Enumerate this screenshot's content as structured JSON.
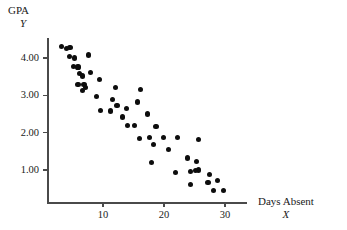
{
  "chart_data": {
    "type": "scatter",
    "title": "",
    "xlabel": "Days Absent",
    "ylabel": "GPA",
    "x_variable": "X",
    "y_variable": "Y",
    "xlim": [
      0,
      33
    ],
    "ylim": [
      0,
      4.6
    ],
    "xticks": [
      10,
      20,
      30
    ],
    "xtick_labels": [
      "10",
      "20",
      "30"
    ],
    "yticks": [
      1.0,
      2.0,
      3.0,
      4.0
    ],
    "ytick_labels": [
      "1.00",
      "2.00",
      "3.00",
      "4.00"
    ],
    "grid": false,
    "legend": false,
    "marker_color": "#0d0d0d",
    "axis_color": "#4a4a4a",
    "series": [
      {
        "name": "Students",
        "points": [
          [
            3.2,
            4.3
          ],
          [
            4.0,
            4.25
          ],
          [
            4.6,
            4.28
          ],
          [
            4.5,
            4.05
          ],
          [
            5.3,
            4.0
          ],
          [
            5.2,
            3.78
          ],
          [
            5.9,
            3.76
          ],
          [
            6.1,
            3.58
          ],
          [
            6.7,
            3.52
          ],
          [
            5.9,
            3.28
          ],
          [
            6.9,
            3.3
          ],
          [
            7.6,
            4.08
          ],
          [
            7.9,
            3.62
          ],
          [
            7.1,
            3.2
          ],
          [
            6.6,
            3.12
          ],
          [
            9.4,
            3.42
          ],
          [
            8.9,
            2.96
          ],
          [
            9.6,
            2.6
          ],
          [
            12.1,
            3.22
          ],
          [
            11.6,
            2.88
          ],
          [
            12.3,
            2.72
          ],
          [
            11.2,
            2.58
          ],
          [
            13.2,
            2.42
          ],
          [
            13.9,
            2.64
          ],
          [
            14.0,
            2.2
          ],
          [
            16.1,
            3.15
          ],
          [
            15.6,
            2.82
          ],
          [
            15.1,
            2.2
          ],
          [
            17.3,
            2.5
          ],
          [
            16.0,
            1.84
          ],
          [
            17.6,
            1.86
          ],
          [
            18.7,
            2.16
          ],
          [
            18.3,
            1.68
          ],
          [
            18.0,
            1.2
          ],
          [
            19.9,
            1.86
          ],
          [
            20.8,
            1.54
          ],
          [
            22.2,
            1.86
          ],
          [
            21.9,
            0.94
          ],
          [
            23.9,
            1.32
          ],
          [
            24.4,
            0.96
          ],
          [
            24.3,
            0.62
          ],
          [
            25.3,
            1.22
          ],
          [
            25.6,
            1.0
          ],
          [
            25.1,
            0.98
          ],
          [
            25.7,
            1.82
          ],
          [
            27.5,
            0.88
          ],
          [
            27.2,
            0.66
          ],
          [
            28.1,
            0.46
          ],
          [
            28.8,
            0.72
          ],
          [
            29.8,
            0.46
          ]
        ]
      }
    ]
  },
  "axes": {
    "y_title": "GPA",
    "y_variable": "Y",
    "x_title": "Days Absent",
    "x_variable": "X"
  }
}
